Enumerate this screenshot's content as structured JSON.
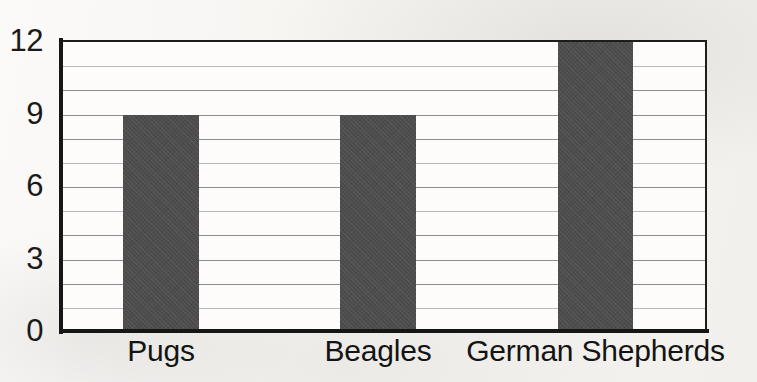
{
  "chart_data": {
    "type": "bar",
    "title": "",
    "subtitle": "",
    "xlabel": "",
    "ylabel": "",
    "categories": [
      "Pugs",
      "Beagles",
      "German Shepherds"
    ],
    "values": [
      9,
      9,
      12
    ],
    "series": [
      {
        "name": "Number of dogs",
        "values": [
          9,
          9,
          12
        ]
      }
    ],
    "ylim": [
      0,
      12
    ],
    "y_tick_labels": [
      "0",
      "3",
      "6",
      "9",
      "12"
    ],
    "y_tick_values": [
      0,
      3,
      6,
      9,
      12
    ],
    "y_gridline_values": [
      0,
      1,
      2,
      3,
      4,
      5,
      6,
      7,
      8,
      9,
      10,
      11,
      12
    ],
    "grid": true,
    "grid_orientation": "horizontal",
    "legend": false,
    "legend_position": "none",
    "annotations": [],
    "colors": {
      "bar_fill": "#4d4d4d",
      "axis": "#161616",
      "gridline": "#8e8e8e",
      "gridline_faint": "#b9b9b9",
      "plot_background": "#fdfcfb",
      "page_background": "#f7f5f2",
      "text": "#141414"
    }
  },
  "axes": {
    "y_ticks": [
      {
        "label": "12",
        "value": 12
      },
      {
        "label": "9",
        "value": 9
      },
      {
        "label": "6",
        "value": 6
      },
      {
        "label": "3",
        "value": 3
      },
      {
        "label": "0",
        "value": 0
      }
    ],
    "x_categories": [
      {
        "label": "Pugs"
      },
      {
        "label": "Beagles"
      },
      {
        "label": "German Shepherds"
      }
    ]
  },
  "bars": [
    {
      "category": "Pugs",
      "value": 9
    },
    {
      "category": "Beagles",
      "value": 9
    },
    {
      "category": "German Shepherds",
      "value": 12
    }
  ]
}
